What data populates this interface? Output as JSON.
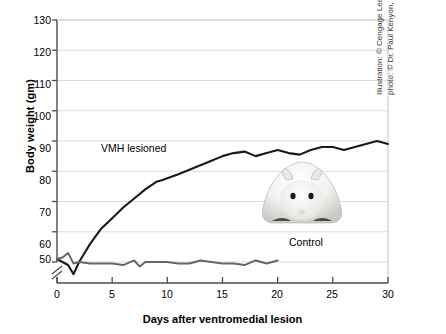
{
  "chart_data": {
    "type": "line",
    "title": "",
    "xlabel": "Days after ventromedial lesion",
    "ylabel": "Body weight (gm)",
    "xlim": [
      0,
      30
    ],
    "ylim": [
      45,
      130
    ],
    "xticks": [
      0,
      5,
      10,
      15,
      20,
      25,
      30
    ],
    "yticks": [
      50,
      60,
      70,
      80,
      90,
      100,
      110,
      120,
      130
    ],
    "grid": "horizontal",
    "y_axis_break": true,
    "legend": "inline-labels",
    "series": [
      {
        "name": "VMH lesioned",
        "color": "#1a1a1a",
        "x": [
          0,
          0.5,
          1,
          1.5,
          2,
          3,
          4,
          5,
          6,
          7,
          8,
          9,
          9.5,
          11,
          12,
          13,
          14,
          15,
          16,
          17,
          18,
          19,
          20,
          21,
          22,
          23,
          24,
          25,
          26,
          27,
          28,
          29,
          30
        ],
        "y": [
          51,
          50,
          49,
          46,
          50,
          56,
          61,
          64.5,
          68,
          71,
          74,
          76.5,
          77,
          79,
          80.5,
          82,
          83.5,
          85,
          86,
          86.5,
          85,
          86,
          87,
          86,
          85.5,
          87,
          88,
          88,
          87,
          88,
          89,
          90,
          89
        ]
      },
      {
        "name": "Control",
        "color": "#666666",
        "x": [
          0,
          0.5,
          1,
          1.5,
          2,
          3,
          4,
          5,
          6,
          7,
          7.5,
          8,
          9,
          10,
          11,
          12,
          13,
          14,
          15,
          16,
          17,
          18,
          19,
          20
        ],
        "y": [
          51,
          51.5,
          53,
          49.5,
          50,
          49.5,
          49.5,
          49.5,
          49,
          50.5,
          48.5,
          50,
          50,
          50,
          49.5,
          49.5,
          50.5,
          50,
          49.5,
          49.5,
          49,
          50.5,
          49.5,
          50.5
        ]
      }
    ],
    "annotations": [
      {
        "name": "vmh-lesioned-label",
        "text": "VMH lesioned"
      },
      {
        "name": "control-label",
        "text": "Control"
      }
    ]
  },
  "credit": {
    "line1": "Illustration: © Cengage Learning 2013;",
    "line2": "photo: © Dr. Paul Kenyon, University of Plymouth"
  },
  "photo": {
    "subject": "obese-hamster-photo",
    "alt": "Photograph of an obese hamster"
  }
}
